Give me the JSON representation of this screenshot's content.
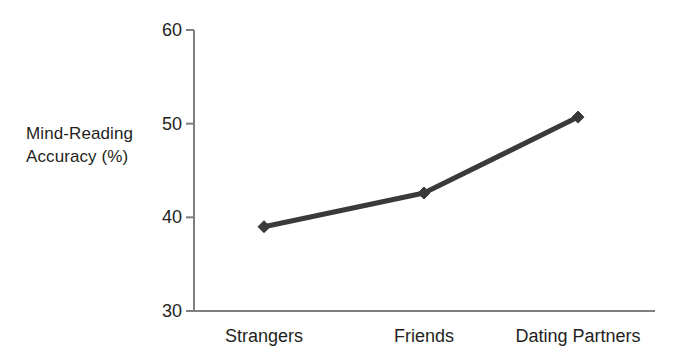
{
  "chart_data": {
    "type": "line",
    "title": "",
    "subtitle": "",
    "xlabel": "",
    "ylabel": "Mind-Reading Accuracy (%)",
    "ylabel_lines": [
      "Mind-Reading",
      "Accuracy (%)"
    ],
    "categories": [
      "Strangers",
      "Friends",
      "Dating Partners"
    ],
    "series": [
      {
        "name": "Mind-Reading Accuracy",
        "values": [
          39.0,
          42.6,
          50.7
        ],
        "color": "#3a3a3a",
        "marker": "diamond"
      }
    ],
    "ylim": [
      30,
      60
    ],
    "y_ticks": [
      30,
      40,
      50,
      60
    ],
    "y_tick_labels": [
      "30",
      "40",
      "50",
      "60"
    ],
    "grid": false,
    "legend": false,
    "legend_position": "none",
    "axis_color": "#7f7f7f",
    "background_color": "#ffffff"
  },
  "axes": {
    "y_label_line1": "Mind-Reading",
    "y_label_line2": "Accuracy (%)"
  }
}
